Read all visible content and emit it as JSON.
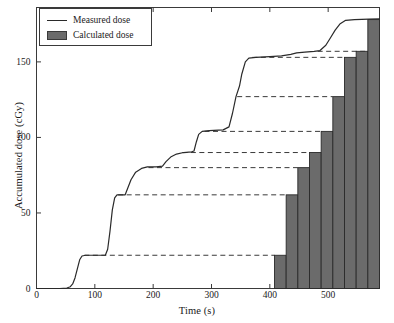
{
  "chart_data": {
    "type": "line",
    "title": "",
    "xlabel": "Time (s)",
    "ylabel": "Accumulated dose (cGy)",
    "xlim": [
      0,
      588
    ],
    "ylim": [
      0,
      186
    ],
    "xticks": [
      0,
      100,
      200,
      300,
      400,
      500
    ],
    "yticks": [
      0,
      50,
      100,
      150
    ],
    "grid": false,
    "legend_position": "top-left",
    "series": [
      {
        "name": "Measured dose",
        "type": "line",
        "color": "#2a2a2a",
        "points": [
          [
            0,
            0
          ],
          [
            40,
            0
          ],
          [
            52,
            0.3
          ],
          [
            58,
            1.2
          ],
          [
            62,
            3
          ],
          [
            66,
            7
          ],
          [
            70,
            13
          ],
          [
            74,
            19
          ],
          [
            78,
            21.5
          ],
          [
            84,
            22
          ],
          [
            110,
            22
          ],
          [
            118,
            22
          ],
          [
            122,
            26
          ],
          [
            126,
            38
          ],
          [
            130,
            52
          ],
          [
            134,
            60
          ],
          [
            138,
            62
          ],
          [
            146,
            62
          ],
          [
            152,
            62
          ],
          [
            156,
            66
          ],
          [
            162,
            72
          ],
          [
            170,
            77
          ],
          [
            180,
            79.5
          ],
          [
            190,
            80.5
          ],
          [
            205,
            80.5
          ],
          [
            216,
            81
          ],
          [
            222,
            84
          ],
          [
            230,
            87
          ],
          [
            240,
            89
          ],
          [
            252,
            90
          ],
          [
            266,
            90.5
          ],
          [
            270,
            91
          ],
          [
            274,
            97
          ],
          [
            278,
            102
          ],
          [
            284,
            104
          ],
          [
            296,
            104.5
          ],
          [
            320,
            105
          ],
          [
            330,
            107
          ],
          [
            336,
            116
          ],
          [
            342,
            127
          ],
          [
            348,
            134
          ],
          [
            352,
            142
          ],
          [
            358,
            150
          ],
          [
            364,
            152.5
          ],
          [
            376,
            153
          ],
          [
            400,
            153.5
          ],
          [
            420,
            154
          ],
          [
            436,
            155
          ],
          [
            446,
            156
          ],
          [
            460,
            156.5
          ],
          [
            476,
            157
          ],
          [
            486,
            157.5
          ],
          [
            496,
            161
          ],
          [
            504,
            166
          ],
          [
            512,
            171
          ],
          [
            520,
            175
          ],
          [
            530,
            177.5
          ],
          [
            545,
            178
          ],
          [
            570,
            178.3
          ],
          [
            588,
            178.5
          ]
        ]
      },
      {
        "name": "Calculated dose",
        "type": "bar",
        "color": "#6b6b6b",
        "edge_color": "#2a2a2a",
        "bar_width": 20,
        "bars": [
          {
            "x_start": 408,
            "x_end": 428,
            "value": 22
          },
          {
            "x_start": 428,
            "x_end": 448,
            "value": 62
          },
          {
            "x_start": 448,
            "x_end": 468,
            "value": 80
          },
          {
            "x_start": 468,
            "x_end": 488,
            "value": 90
          },
          {
            "x_start": 488,
            "x_end": 508,
            "value": 104
          },
          {
            "x_start": 508,
            "x_end": 528,
            "value": 127
          },
          {
            "x_start": 528,
            "x_end": 548,
            "value": 153
          },
          {
            "x_start": 548,
            "x_end": 568,
            "value": 157
          },
          {
            "x_start": 568,
            "x_end": 588,
            "value": 178
          }
        ]
      },
      {
        "name": "Plateau reference levels",
        "type": "dashed-guides",
        "color": "#3a3a3a",
        "levels": [
          {
            "value": 22,
            "x_start": 82,
            "x_end": 408
          },
          {
            "value": 62,
            "x_start": 140,
            "x_end": 428
          },
          {
            "value": 80,
            "x_start": 192,
            "x_end": 448
          },
          {
            "value": 90,
            "x_start": 250,
            "x_end": 468
          },
          {
            "value": 104,
            "x_start": 288,
            "x_end": 488
          },
          {
            "value": 127,
            "x_start": 344,
            "x_end": 508
          },
          {
            "value": 153,
            "x_start": 370,
            "x_end": 528
          },
          {
            "value": 157,
            "x_start": 482,
            "x_end": 568
          }
        ]
      }
    ]
  },
  "legend": {
    "items": [
      {
        "label": "Measured dose",
        "marker": "line"
      },
      {
        "label": "Calculated dose",
        "marker": "swatch"
      }
    ]
  },
  "axes": {
    "x_tick_labels": [
      "0",
      "100",
      "200",
      "300",
      "400",
      "500"
    ],
    "y_tick_labels": [
      "0",
      "50",
      "100",
      "150"
    ]
  },
  "colors": {
    "line": "#2a2a2a",
    "bar_fill": "#6b6b6b",
    "bar_edge": "#2a2a2a",
    "axis": "#3a3a3a",
    "background": "#ffffff"
  }
}
